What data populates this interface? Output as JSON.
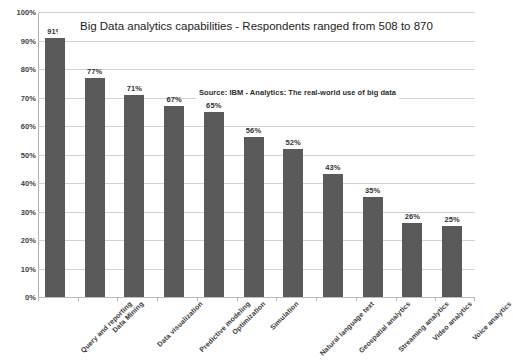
{
  "chart_data": {
    "type": "bar",
    "title": "Big Data analytics capabilities - Respondents ranged from 508 to 870",
    "source_note": "Source: IBM - Analytics: The real-world use of big data",
    "xlabel": "",
    "ylabel": "",
    "ylim": [
      0,
      100
    ],
    "ytick_step": 10,
    "grid": "horizontal",
    "legend": "none",
    "bar_color": "#5a5a5a",
    "gridline_color": "#d2d2d2",
    "value_label_suffix": "%",
    "categories": [
      "Query and reporting",
      "Data Mining",
      "Data visualization",
      "Predictive modeling",
      "Optimization",
      "Simulation",
      "Natural language text",
      "Geospatial analytics",
      "Streaming analytics",
      "Video analytics",
      "Voice analytics"
    ],
    "values": [
      91,
      77,
      71,
      67,
      65,
      56,
      52,
      43,
      35,
      26,
      25
    ],
    "value_labels": [
      "91%",
      "77%",
      "71%",
      "67%",
      "65%",
      "56%",
      "52%",
      "43%",
      "35%",
      "26%",
      "25%"
    ],
    "ytick_labels": [
      "100%",
      "90%",
      "80%",
      "70%",
      "60%",
      "50%",
      "40%",
      "30%",
      "20%",
      "10%",
      "0%"
    ],
    "yticks": [
      100,
      90,
      80,
      70,
      60,
      50,
      40,
      30,
      20,
      10,
      0
    ]
  }
}
